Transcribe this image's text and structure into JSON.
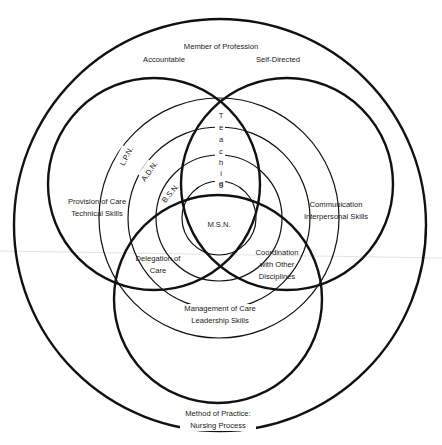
{
  "diagram": {
    "outer_label": {
      "title": "Member of Profession",
      "left": "Accountable",
      "right": "Self-Directed"
    },
    "bottom_label": {
      "line1": "Method of Practice:",
      "line2": "Nursing Process"
    },
    "circles": {
      "provision": {
        "line1": "Provision of Care",
        "line2": "Technical Skills"
      },
      "communication": {
        "line1": "Communication",
        "line2": "Interpersonal Skills"
      },
      "management": {
        "line1": "Management of Care",
        "line2": "Leadership Skills"
      }
    },
    "overlaps": {
      "teaching": [
        "T",
        "e",
        "a",
        "c",
        "h",
        "i",
        "n",
        "g"
      ],
      "delegation": {
        "line1": "Delegation of",
        "line2": "Care"
      },
      "coordination": {
        "line1": "Coordination",
        "line2": "with Other",
        "line3": "Disciplines"
      }
    },
    "levels": {
      "lpn": "L.P.N.",
      "adn": "A.D.N.",
      "bsn": "B.S.N.",
      "msn": "M.S.N."
    },
    "colors": {
      "line": "#111111",
      "background": "#ffffff",
      "text": "#1a1a1a"
    }
  }
}
